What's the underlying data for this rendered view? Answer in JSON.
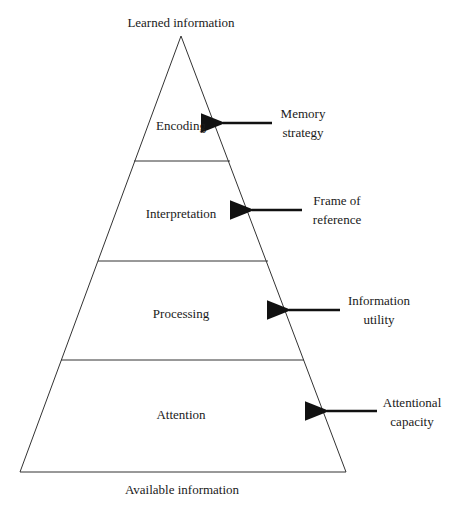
{
  "diagram": {
    "type": "pyramid",
    "top_label": "Learned information",
    "bottom_label": "Available information",
    "levels": [
      {
        "name": "Encoding",
        "annotation_line1": "Memory",
        "annotation_line2": "strategy"
      },
      {
        "name": "Interpretation",
        "annotation_line1": "Frame of",
        "annotation_line2": "reference"
      },
      {
        "name": "Processing",
        "annotation_line1": "Information",
        "annotation_line2": "utility"
      },
      {
        "name": "Attention",
        "annotation_line1": "Attentional",
        "annotation_line2": "capacity"
      }
    ],
    "colors": {
      "stroke": "#333333",
      "arrow": "#111111",
      "background": "#ffffff"
    }
  }
}
